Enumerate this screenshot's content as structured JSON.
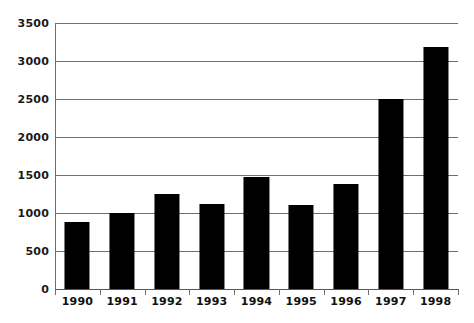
{
  "chart_data": {
    "type": "bar",
    "title": "",
    "subtitle": "",
    "xlabel": "",
    "ylabel": "",
    "categories": [
      "1990",
      "1991",
      "1992",
      "1993",
      "1994",
      "1995",
      "1996",
      "1997",
      "1998"
    ],
    "values": [
      880,
      1000,
      1250,
      1120,
      1480,
      1100,
      1380,
      2500,
      3180
    ],
    "series": [
      {
        "name": "",
        "values": [
          880,
          1000,
          1250,
          1120,
          1480,
          1100,
          1380,
          2500,
          3180
        ]
      }
    ],
    "ylim": [
      0,
      3500
    ],
    "ytick_labels": [
      "0",
      "500",
      "1000",
      "1500",
      "2000",
      "2500",
      "3000",
      "3500"
    ],
    "ytick_values": [
      0,
      500,
      1000,
      1500,
      2000,
      2500,
      3000,
      3500
    ],
    "xtick_labels": [
      "1990",
      "1991",
      "1992",
      "1993",
      "1994",
      "1995",
      "1996",
      "1997",
      "1998"
    ],
    "grid": true,
    "grid_axis": "y",
    "legend": false,
    "legend_position": "none",
    "annotations": [],
    "colors": {
      "bar": "#000000",
      "grid": "#6e6e6e",
      "axis": "#6e6e6e",
      "text": "#111111",
      "background": "#ffffff"
    }
  }
}
